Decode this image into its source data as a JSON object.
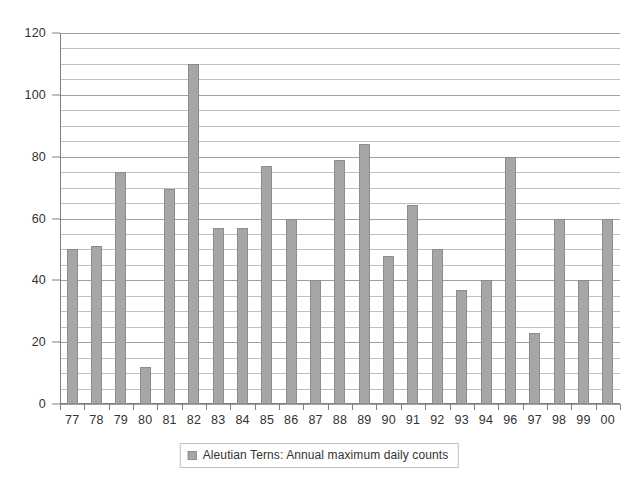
{
  "chart_data": {
    "type": "bar",
    "title": "",
    "xlabel": "",
    "ylabel": "",
    "ylim": [
      0,
      120
    ],
    "ytick_values": [
      0,
      20,
      40,
      60,
      80,
      100,
      120
    ],
    "ytick_labels": [
      "0",
      "20",
      "40",
      "60",
      "80",
      "100",
      "120"
    ],
    "minor_gridline_step": 5,
    "grid": true,
    "legend_position": "bottom-center",
    "categories": [
      "77",
      "78",
      "79",
      "80",
      "81",
      "82",
      "83",
      "84",
      "85",
      "86",
      "87",
      "88",
      "89",
      "90",
      "91",
      "92",
      "93",
      "94",
      "96",
      "97",
      "98",
      "99",
      "00"
    ],
    "values": [
      50,
      51,
      75,
      12,
      69.5,
      110,
      57,
      57,
      77,
      60,
      40,
      79,
      84,
      48,
      64.5,
      50,
      37,
      40,
      80,
      23,
      60,
      40,
      60
    ],
    "series": [
      {
        "name": "Aleutian Terns: Annual maximum daily counts",
        "values": [
          50,
          51,
          75,
          12,
          69.5,
          110,
          57,
          57,
          77,
          60,
          40,
          79,
          84,
          48,
          64.5,
          50,
          37,
          40,
          80,
          23,
          60,
          40,
          60
        ]
      }
    ],
    "bar_color": "#a6a6a6",
    "bar_border_color": "#8c8c8c",
    "gridline_color": "#bfbfbf",
    "axis_color": "#808080"
  },
  "legend": {
    "entries": [
      {
        "label": "Aleutian Terns: Annual maximum daily counts",
        "color": "#a6a6a6"
      }
    ]
  }
}
